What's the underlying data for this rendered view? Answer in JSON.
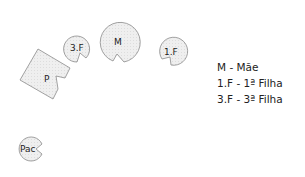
{
  "shapes": {
    "mother": {
      "label": "M",
      "shape": "circle-with-notch"
    },
    "first_daughter": {
      "label": "1.F",
      "shape": "circle-with-notch"
    },
    "third_daughter": {
      "label": "3.F",
      "shape": "circle-with-notch"
    },
    "father": {
      "label": "P",
      "shape": "square-with-notch"
    },
    "patient": {
      "label": "Pac",
      "shape": "circle-with-notch"
    }
  },
  "legend": {
    "items": [
      "M - Mãe",
      "1.F - 1ª Filha",
      "3.F - 3ª Filha"
    ]
  },
  "colors": {
    "fill": "#ececec",
    "stroke": "#8a8a8a",
    "text": "#222222"
  }
}
